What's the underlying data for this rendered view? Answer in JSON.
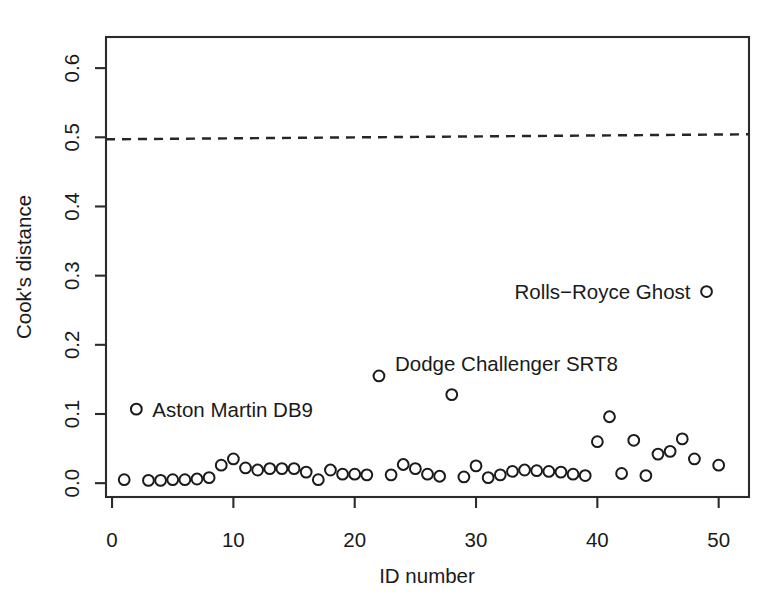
{
  "figure": {
    "background_color": "#ffffff",
    "foreground_color": "#1a1a1a",
    "point_stroke_color": "#1b1b1b",
    "threshold_color": "#262626"
  },
  "axes": {
    "x_title": "ID number",
    "y_title": "Cook's distance",
    "x_ticks": [
      "0",
      "10",
      "20",
      "30",
      "40",
      "50"
    ],
    "y_ticks": [
      "0.0",
      "0.1",
      "0.2",
      "0.3",
      "0.4",
      "0.5",
      "0.6"
    ]
  },
  "annotations": {
    "aston": "Aston Martin DB9",
    "dodge": "Dodge Challenger SRT8",
    "rolls": "Rolls−Royce Ghost"
  },
  "chart_data": {
    "type": "scatter",
    "title": "",
    "xlabel": "ID number",
    "ylabel": "Cook's distance",
    "xlim": [
      -0.5,
      52.5
    ],
    "ylim": [
      -0.02,
      0.645
    ],
    "x_ticks": [
      0,
      10,
      20,
      30,
      40,
      50
    ],
    "y_ticks": [
      0.0,
      0.1,
      0.2,
      0.3,
      0.4,
      0.5,
      0.6
    ],
    "grid": false,
    "legend": "none",
    "marker": "open-circle",
    "threshold_line": {
      "y": 0.5,
      "style": "dashed",
      "label": "Cook's distance cutoff"
    },
    "x": [
      1,
      2,
      3,
      4,
      5,
      6,
      7,
      8,
      9,
      10,
      11,
      12,
      13,
      14,
      15,
      16,
      17,
      18,
      19,
      20,
      21,
      22,
      23,
      24,
      25,
      26,
      27,
      28,
      29,
      30,
      31,
      32,
      33,
      34,
      35,
      36,
      37,
      38,
      39,
      40,
      41,
      42,
      43,
      44,
      45,
      46,
      47,
      48,
      49,
      50
    ],
    "values": [
      0.005,
      0.107,
      0.004,
      0.004,
      0.005,
      0.005,
      0.006,
      0.008,
      0.026,
      0.035,
      0.022,
      0.019,
      0.021,
      0.021,
      0.021,
      0.016,
      0.005,
      0.019,
      0.013,
      0.013,
      0.012,
      0.155,
      0.012,
      0.027,
      0.021,
      0.013,
      0.01,
      0.128,
      0.009,
      0.025,
      0.008,
      0.012,
      0.017,
      0.019,
      0.018,
      0.017,
      0.016,
      0.013,
      0.011,
      0.06,
      0.096,
      0.014,
      0.062,
      0.011,
      0.042,
      0.046,
      0.064,
      0.035,
      0.277,
      0.026
    ],
    "labeled_points": [
      {
        "id": 2,
        "label": "Aston Martin DB9",
        "value": 0.107,
        "label_side": "right"
      },
      {
        "id": 22,
        "label": "Dodge Challenger SRT8",
        "value": 0.155,
        "label_side": "right"
      },
      {
        "id": 49,
        "label": "Rolls−Royce Ghost",
        "value": 0.277,
        "label_side": "left"
      }
    ]
  }
}
